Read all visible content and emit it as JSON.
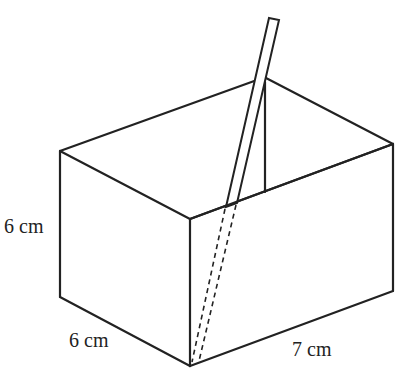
{
  "diagram": {
    "labels": {
      "height": "6 cm",
      "width": "6 cm",
      "length": "7 cm"
    },
    "dimensions": {
      "height_cm": 6,
      "width_cm": 6,
      "length_cm": 7
    },
    "colors": {
      "line": "#222222",
      "background": "#ffffff"
    }
  }
}
